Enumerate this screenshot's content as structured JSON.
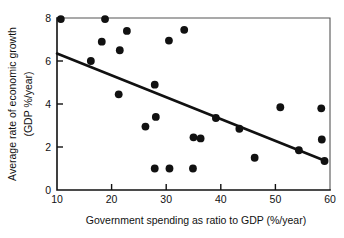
{
  "chart_data": {
    "type": "scatter",
    "title": "",
    "xlabel": "Government spending as ratio to GDP (%/year)",
    "ylabel_line1": "Average rate of economic growth",
    "ylabel_line2": "(GDP %/year)",
    "xlim": [
      10,
      60
    ],
    "ylim": [
      0,
      8
    ],
    "xticks": [
      10,
      20,
      30,
      40,
      50,
      60
    ],
    "yticks": [
      0,
      2,
      4,
      6,
      8
    ],
    "xtick_labels": [
      "10",
      "20",
      "30",
      "40",
      "50",
      "60"
    ],
    "ytick_labels": [
      "0",
      "2",
      "4",
      "6",
      "8"
    ],
    "grid": false,
    "legend": "none",
    "marker": "filled-circle",
    "marker_color": "#111111",
    "points": [
      {
        "x": 10.7,
        "y": 7.95
      },
      {
        "x": 16.2,
        "y": 6.0
      },
      {
        "x": 18.2,
        "y": 6.9
      },
      {
        "x": 18.8,
        "y": 7.95
      },
      {
        "x": 21.3,
        "y": 4.45
      },
      {
        "x": 21.5,
        "y": 6.5
      },
      {
        "x": 22.8,
        "y": 7.4
      },
      {
        "x": 26.2,
        "y": 2.95
      },
      {
        "x": 27.9,
        "y": 4.9
      },
      {
        "x": 27.9,
        "y": 1.0
      },
      {
        "x": 28.1,
        "y": 3.4
      },
      {
        "x": 30.5,
        "y": 6.95
      },
      {
        "x": 30.6,
        "y": 1.0
      },
      {
        "x": 33.3,
        "y": 7.45
      },
      {
        "x": 34.9,
        "y": 1.0
      },
      {
        "x": 35.0,
        "y": 2.45
      },
      {
        "x": 36.3,
        "y": 2.4
      },
      {
        "x": 39.1,
        "y": 3.35
      },
      {
        "x": 43.4,
        "y": 2.85
      },
      {
        "x": 46.2,
        "y": 1.5
      },
      {
        "x": 50.9,
        "y": 3.85
      },
      {
        "x": 54.3,
        "y": 1.85
      },
      {
        "x": 58.4,
        "y": 3.8
      },
      {
        "x": 58.5,
        "y": 2.35
      },
      {
        "x": 59.0,
        "y": 1.35
      }
    ],
    "trendline": {
      "x_start": 10.0,
      "y_start": 6.35,
      "x_end": 59.2,
      "y_end": 1.35,
      "color": "#111111",
      "type": "linear-fit"
    }
  }
}
